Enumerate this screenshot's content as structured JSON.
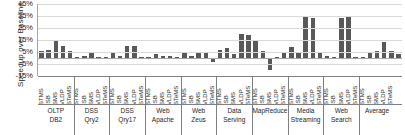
{
  "chart_data": {
    "type": "bar",
    "title": "",
    "xlabel": "",
    "ylabel": "Speedup over Baseline",
    "ylim": [
      -15,
      45
    ],
    "yticks": [
      45,
      35,
      25,
      15,
      5,
      -5,
      -15
    ],
    "ytick_labels": [
      "45%",
      "35%",
      "25%",
      "15%",
      "5%",
      "-5%",
      "-15%"
    ],
    "grid": true,
    "legend": "none",
    "categories": [
      "STMS",
      "ISB",
      "SMS",
      "VLDP",
      "STeMS"
    ],
    "bar_color": "#595959",
    "groups": [
      {
        "line1": "OLTP",
        "line2": "DB2",
        "values": [
          6,
          7,
          14,
          10,
          6
        ]
      },
      {
        "line1": "DSS",
        "line2": "Qry2",
        "values": [
          1,
          1.5,
          4,
          1,
          0.5
        ]
      },
      {
        "line1": "DSS",
        "line2": "Qry17",
        "values": [
          4,
          2,
          10,
          10,
          1
        ]
      },
      {
        "line1": "Web",
        "line2": "Apache",
        "values": [
          1,
          3,
          2,
          2,
          1
        ]
      },
      {
        "line1": "Web",
        "line2": "Zeus",
        "values": [
          4,
          2,
          5,
          5,
          -3
        ]
      },
      {
        "line1": "Data",
        "line2": "Serving",
        "values": [
          7,
          8,
          3,
          20,
          19
        ]
      },
      {
        "line1": "MapReduce",
        "line2": "",
        "values": [
          14,
          6,
          -10,
          1,
          4
        ]
      },
      {
        "line1": "Media",
        "line2": "Streaming",
        "values": [
          9,
          4,
          34,
          33,
          4
        ]
      },
      {
        "line1": "Web",
        "line2": "Search",
        "values": [
          2,
          1,
          33,
          35,
          1
        ]
      },
      {
        "line1": "Average",
        "line2": "",
        "values": [
          1,
          5,
          6,
          13,
          6
        ]
      },
      {
        "line1": "",
        "line2": "",
        "values": [
          3
        ]
      }
    ]
  }
}
